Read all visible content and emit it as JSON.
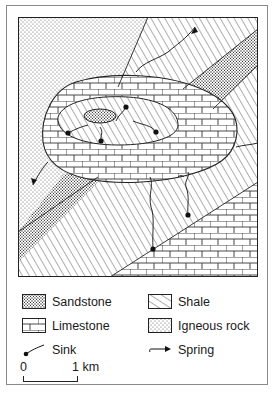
{
  "map": {
    "title": "Geological map: limestone outcrop with sinks and springs",
    "units": [
      "Sandstone",
      "Shale",
      "Limestone",
      "Igneous rock"
    ],
    "features": {
      "sinks": 6,
      "springs": 4
    }
  },
  "legend": {
    "items": [
      {
        "id": "sandstone",
        "label": "Sandstone",
        "pattern": "coarse-dots"
      },
      {
        "id": "shale",
        "label": "Shale",
        "pattern": "diagonal-lines"
      },
      {
        "id": "limestone",
        "label": "Limestone",
        "pattern": "brick"
      },
      {
        "id": "igneous",
        "label": "Igneous rock",
        "pattern": "fine-dots"
      },
      {
        "id": "sink",
        "label": "Sink",
        "pattern": "dot-with-line"
      },
      {
        "id": "spring",
        "label": "Spring",
        "pattern": "arrow"
      }
    ]
  },
  "scale": {
    "start": "0",
    "end": "1 km"
  },
  "colors": {
    "ink": "#1a1a1a",
    "frame": "#8a8a8a",
    "background": "#ffffff"
  }
}
